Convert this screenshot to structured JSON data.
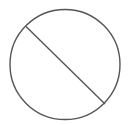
{
  "icon": {
    "name": "prohibited-icon",
    "stroke_color": "#555555",
    "background": "#ffffff"
  }
}
